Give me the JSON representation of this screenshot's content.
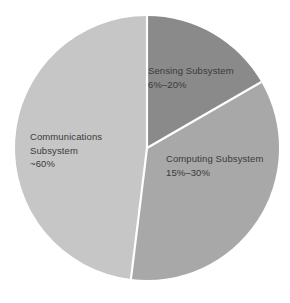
{
  "chart_data": {
    "type": "pie",
    "title": "",
    "subtitle": "",
    "xlabel": "",
    "ylabel": "",
    "legend_position": "none",
    "grid": false,
    "labels_inside": true,
    "background_color": "#ffffff",
    "separator_color": "#ffffff",
    "text_color": "#3a3a3a",
    "center": {
      "x": 147,
      "y": 148
    },
    "radius": 132,
    "start_angle_deg": 0,
    "direction": "clockwise",
    "categories": [
      "Sensing Subsystem",
      "Computing Subsystem",
      "Communications Subsystem"
    ],
    "values": [
      16.7,
      35.3,
      48.0
    ],
    "value_labels": [
      "6%–20%",
      "15%–30%",
      "~60%"
    ],
    "colors": [
      "#8a8a8a",
      "#a8a8a8",
      "#c6c6c6"
    ],
    "slices": [
      {
        "name": "Sensing Subsystem",
        "value_label": "6%–20%",
        "color": "#8a8a8a",
        "start_angle_deg": 0,
        "end_angle_deg": 60,
        "sweep_deg": 60,
        "share_pct": 16.7,
        "range_min_pct": 6,
        "range_max_pct": 20
      },
      {
        "name": "Computing Subsystem",
        "value_label": "15%–30%",
        "color": "#a8a8a8",
        "start_angle_deg": 60,
        "end_angle_deg": 187,
        "sweep_deg": 127,
        "share_pct": 35.3,
        "range_min_pct": 15,
        "range_max_pct": 30
      },
      {
        "name": "Communications Subsystem",
        "value_label": "~60%",
        "color": "#c6c6c6",
        "start_angle_deg": 187,
        "end_angle_deg": 360,
        "sweep_deg": 173,
        "share_pct": 48.0,
        "approx_pct": 60
      }
    ]
  },
  "labels": {
    "sensing": {
      "name": "Sensing Subsystem",
      "value": "6%–20%"
    },
    "computing": {
      "name": "Computing Subsystem",
      "value": "15%–30%"
    },
    "communications": {
      "name_line1": "Communications",
      "name_line2": "Subsystem",
      "value": "~60%"
    }
  }
}
